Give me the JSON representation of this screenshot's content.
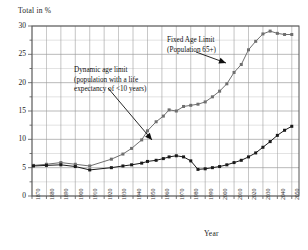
{
  "chart_data": {
    "type": "line",
    "title": "",
    "ylabel": "Total in %",
    "xlabel": "Year",
    "ylim": [
      0,
      30
    ],
    "xlim": [
      1870,
      2055
    ],
    "grid": true,
    "y_ticks": [
      0,
      5,
      10,
      15,
      20,
      25,
      30
    ],
    "y_minor_step": 2.5,
    "x_ticks": [
      1870,
      1880,
      1890,
      1900,
      1910,
      1920,
      1930,
      1940,
      1950,
      1960,
      1970,
      1980,
      1990,
      2000,
      2010,
      2020,
      2030,
      2040,
      2050
    ],
    "legend_position": "inline-annotations",
    "series": [
      {
        "name": "Fixed Age Limit (Population 65+)",
        "color": "#6f6f6f",
        "marker": "square",
        "x": [
          1871,
          1880,
          1890,
          1900,
          1910,
          1925,
          1933,
          1939,
          1946,
          1950,
          1956,
          1961,
          1965,
          1970,
          1975,
          1980,
          1985,
          1990,
          1995,
          2000,
          2005,
          2010,
          2015,
          2020,
          2025,
          2030,
          2035,
          2040,
          2045,
          2050
        ],
        "y": [
          5.4,
          5.6,
          5.9,
          5.6,
          5.3,
          6.5,
          7.4,
          8.4,
          9.9,
          11.5,
          13.1,
          14.1,
          15.2,
          15.0,
          15.8,
          16.0,
          16.2,
          16.6,
          17.5,
          18.5,
          19.8,
          21.8,
          23.2,
          25.8,
          27.3,
          28.6,
          29.1,
          28.7,
          28.5,
          28.5
        ]
      },
      {
        "name": "Dynamic age limit (population with a life expectancy of <10 years)",
        "color": "#1a1a1a",
        "marker": "square",
        "x": [
          1871,
          1880,
          1890,
          1900,
          1910,
          1925,
          1933,
          1939,
          1946,
          1950,
          1956,
          1961,
          1965,
          1970,
          1975,
          1980,
          1985,
          1990,
          1995,
          2000,
          2005,
          2010,
          2015,
          2020,
          2025,
          2030,
          2035,
          2040,
          2045,
          2050
        ],
        "y": [
          5.3,
          5.4,
          5.5,
          5.2,
          4.6,
          5.0,
          5.3,
          5.5,
          5.8,
          6.1,
          6.3,
          6.6,
          6.9,
          7.1,
          6.9,
          6.2,
          4.7,
          4.8,
          5.0,
          5.2,
          5.5,
          5.9,
          6.3,
          6.9,
          7.6,
          8.6,
          9.6,
          10.7,
          11.6,
          12.3
        ]
      }
    ],
    "annotations": [
      {
        "id": "fixed",
        "lines": [
          "Fixed Age Limit",
          "(Population 65+)"
        ],
        "arrow": true
      },
      {
        "id": "dynamic",
        "lines": [
          "Dynamic age limit",
          "(population with a life",
          "expectancy of <10 years)"
        ],
        "arrow": true
      }
    ]
  },
  "labels": {
    "y_axis_title": "Total in %",
    "x_axis_title": "Year",
    "annot_fixed_l1": "Fixed Age Limit",
    "annot_fixed_l2": "(Population 65+)",
    "annot_dyn_l1": "Dynamic age limit",
    "annot_dyn_l2": "(population with a life",
    "annot_dyn_l3": "expectancy of <10 years)"
  },
  "colors": {
    "series_fixed": "#6f6f6f",
    "series_dynamic": "#1a1a1a",
    "grid": "#9a9a9a",
    "frame": "#555555",
    "background": "#ffffff"
  }
}
